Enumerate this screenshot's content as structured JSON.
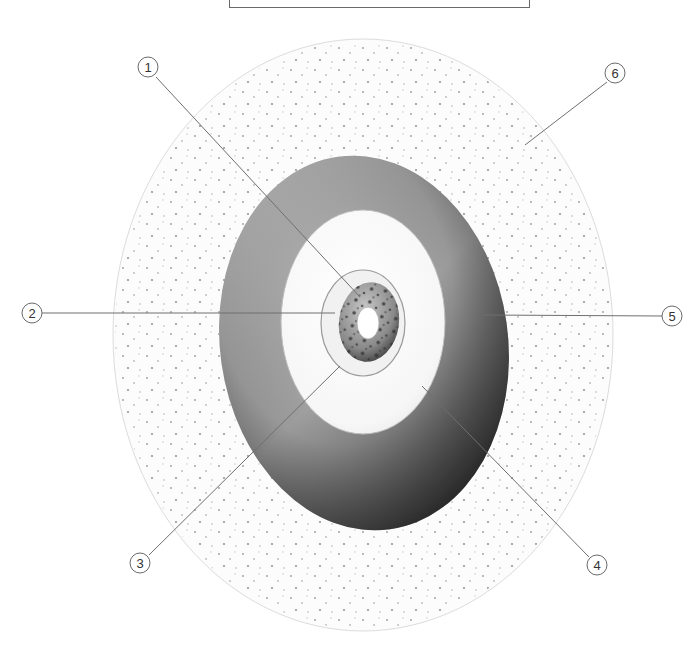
{
  "title_box": {
    "text": ""
  },
  "diagram": {
    "layers": [
      {
        "id": "outer-speckled-zone",
        "fill": "#fbfbfb",
        "stroke": "#d6d6d6"
      },
      {
        "id": "dark-ring",
        "fill": "#8a8a8a"
      },
      {
        "id": "pale-inner-zone",
        "fill": "#f4f4f4"
      },
      {
        "id": "thin-inner-ring",
        "fill": "#f0f0f0"
      },
      {
        "id": "speckled-core",
        "fill": "#8c8c8c"
      },
      {
        "id": "white-center",
        "fill": "#ffffff"
      }
    ]
  },
  "callouts": [
    {
      "number": "1",
      "cx": 148,
      "cy": 67,
      "tx": 360,
      "ty": 297
    },
    {
      "number": "2",
      "cx": 32,
      "cy": 313,
      "tx": 335,
      "ty": 313
    },
    {
      "number": "3",
      "cx": 140,
      "cy": 563,
      "tx": 340,
      "ty": 366
    },
    {
      "number": "4",
      "cx": 597,
      "cy": 565,
      "tx": 422,
      "ty": 386
    },
    {
      "number": "5",
      "cx": 672,
      "cy": 316,
      "tx": 483,
      "ty": 315
    },
    {
      "number": "6",
      "cx": 615,
      "cy": 73,
      "tx": 525,
      "ty": 145
    }
  ],
  "colors": {
    "line": "#6f6f6f",
    "circle_stroke": "#6a6a6a",
    "label_text": "#333333"
  }
}
